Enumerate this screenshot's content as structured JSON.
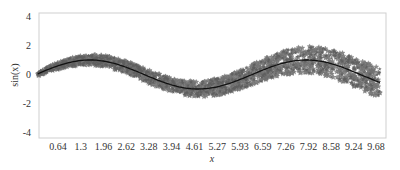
{
  "chart_data": {
    "type": "scatter",
    "title": "",
    "xlabel": "x",
    "ylabel": "sin(x)",
    "xlim": [
      0.05,
      10.0
    ],
    "ylim": [
      -4.6,
      4.6
    ],
    "grid": false,
    "legend": null,
    "x_ticks": [
      0.64,
      1.3,
      1.96,
      2.62,
      3.28,
      3.94,
      4.61,
      5.27,
      5.93,
      6.59,
      7.26,
      7.92,
      8.58,
      9.24,
      9.68
    ],
    "x_tick_labels": [
      "0.64",
      "1.3",
      "1.96",
      "2.62",
      "3.28",
      "3.94",
      "4.61",
      "5.27",
      "5.93",
      "6.59",
      "7.26",
      "7.92",
      "8.58",
      "9.24",
      "9.68"
    ],
    "y_ticks": [
      4,
      2,
      0,
      -2,
      -4
    ],
    "y_tick_labels": [
      "4",
      "2",
      "0",
      "-2",
      "-4"
    ],
    "series": [
      {
        "name": "sin(x)",
        "kind": "line",
        "color": "#111111",
        "x": [
          0.05,
          0.5,
          1.0,
          1.5,
          1.57,
          2.0,
          2.5,
          3.0,
          3.14,
          3.5,
          4.0,
          4.5,
          4.71,
          5.0,
          5.5,
          6.0,
          6.28,
          6.5,
          7.0,
          7.5,
          7.85,
          8.0,
          8.5,
          9.0,
          9.42,
          9.5,
          10.0
        ],
        "y": [
          0.05,
          0.48,
          0.84,
          1.0,
          1.0,
          0.91,
          0.6,
          0.14,
          0.0,
          -0.35,
          -0.76,
          -0.98,
          -1.0,
          -0.96,
          -0.71,
          -0.28,
          0.0,
          0.22,
          0.66,
          0.94,
          1.0,
          0.99,
          0.8,
          0.41,
          0.0,
          -0.08,
          -0.54
        ]
      },
      {
        "name": "noisy samples",
        "kind": "scatter",
        "marker": "star",
        "color": "#6e6e6e",
        "noise_envelope": {
          "x": [
            0.05,
            1.0,
            2.0,
            3.0,
            4.0,
            5.0,
            6.0,
            7.0,
            8.0,
            9.0,
            10.0
          ],
          "half_width": [
            0.15,
            0.3,
            0.4,
            0.45,
            0.5,
            0.55,
            0.65,
            0.8,
            0.95,
            1.0,
            1.05
          ]
        },
        "sample_count": 1500
      }
    ]
  }
}
